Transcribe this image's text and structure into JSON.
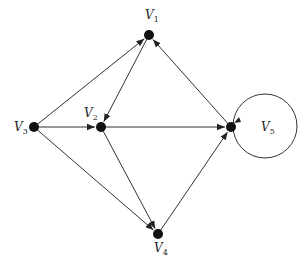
{
  "diagram": {
    "type": "directed-graph",
    "colors": {
      "stroke": "#333333",
      "node": "#111111",
      "background": "#ffffff"
    },
    "nodes": [
      {
        "id": "v1",
        "label": "V",
        "sub": "1",
        "x": 149,
        "y": 35,
        "lx": 145,
        "ly": 19
      },
      {
        "id": "v2",
        "label": "V",
        "sub": "2",
        "x": 101,
        "y": 127,
        "lx": 84,
        "ly": 117
      },
      {
        "id": "v3",
        "label": "V",
        "sub": "3",
        "x": 34,
        "y": 127,
        "lx": 14,
        "ly": 131
      },
      {
        "id": "v4",
        "label": "V",
        "sub": "4",
        "x": 158,
        "y": 234,
        "lx": 154,
        "ly": 252
      },
      {
        "id": "v5",
        "label": "V",
        "sub": "5",
        "x": 231,
        "y": 127,
        "lx": 261,
        "ly": 131
      }
    ],
    "edges": [
      {
        "from": "v3",
        "to": "v1"
      },
      {
        "from": "v3",
        "to": "v2"
      },
      {
        "from": "v3",
        "to": "v4"
      },
      {
        "from": "v1",
        "to": "v2"
      },
      {
        "from": "v2",
        "to": "v5"
      },
      {
        "from": "v2",
        "to": "v4"
      },
      {
        "from": "v4",
        "to": "v5"
      },
      {
        "from": "v5",
        "to": "v1"
      },
      {
        "from": "v5",
        "to": "v5",
        "loop": true,
        "cx": 265,
        "cy": 126,
        "r": 32
      }
    ]
  }
}
